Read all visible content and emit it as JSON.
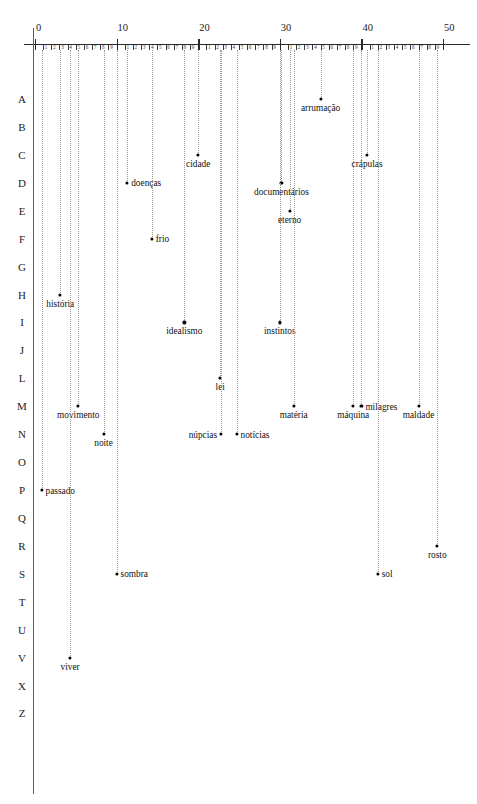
{
  "chart_data": {
    "type": "scatter",
    "title": "",
    "subtitle": "",
    "xlabel": "",
    "ylabel": "",
    "xlim": [
      0,
      52
    ],
    "ylim_categories": [
      "A",
      "B",
      "C",
      "D",
      "E",
      "F",
      "G",
      "H",
      "I",
      "J",
      "L",
      "M",
      "N",
      "O",
      "P",
      "Q",
      "R",
      "S",
      "T",
      "U",
      "V",
      "X",
      "Z"
    ],
    "grid": "vertical dotted stems dropping from top axis to each point",
    "legend": "none",
    "x_axis": {
      "major_ticks": [
        0,
        10,
        20,
        30,
        40,
        50
      ],
      "major_tick_labels": [
        "0",
        "10",
        "20",
        "30",
        "40",
        "50"
      ],
      "minor_tick_labels": [
        "1",
        "2",
        "3",
        "4",
        "5",
        "6",
        "7",
        "8",
        "9"
      ],
      "minor_ticks_per_interval": 9,
      "position": "top"
    },
    "y_axis": {
      "categories": [
        "A",
        "B",
        "C",
        "D",
        "E",
        "F",
        "G",
        "H",
        "I",
        "J",
        "L",
        "M",
        "N",
        "O",
        "P",
        "Q",
        "R",
        "S",
        "T",
        "U",
        "V",
        "X",
        "Z"
      ],
      "note": "Portuguese alphabet row labels; K, W and Y omitted",
      "position": "left"
    },
    "points": [
      {
        "label": "arrumação",
        "x": 35.0,
        "row": "A",
        "label_side": "below"
      },
      {
        "label": "cidade",
        "x": 20.0,
        "row": "C",
        "label_side": "below"
      },
      {
        "label": "crápulas",
        "x": 40.7,
        "row": "C",
        "label_side": "below"
      },
      {
        "label": "doenças",
        "x": 11.3,
        "row": "D",
        "label_side": "right"
      },
      {
        "label": "documentários",
        "x": 30.2,
        "row": "D",
        "label_side": "below"
      },
      {
        "label": "eterno",
        "x": 31.2,
        "row": "E",
        "label_side": "below"
      },
      {
        "label": "frio",
        "x": 14.3,
        "row": "F",
        "label_side": "right"
      },
      {
        "label": "história",
        "x": 3.1,
        "row": "H",
        "label_side": "below"
      },
      {
        "label": "idealismo",
        "x": 18.3,
        "row": "I",
        "label_side": "below"
      },
      {
        "label": "instintos",
        "x": 30.0,
        "row": "I",
        "label_side": "below"
      },
      {
        "label": "lei",
        "x": 22.7,
        "row": "L",
        "label_side": "below"
      },
      {
        "label": "movimento",
        "x": 5.3,
        "row": "M",
        "label_side": "below"
      },
      {
        "label": "matéria",
        "x": 31.7,
        "row": "M",
        "label_side": "below"
      },
      {
        "label": "máquina",
        "x": 39.0,
        "row": "M",
        "label_side": "below"
      },
      {
        "label": "milagres",
        "x": 40.0,
        "row": "M",
        "label_side": "right"
      },
      {
        "label": "maldade",
        "x": 47.0,
        "row": "M",
        "label_side": "below"
      },
      {
        "label": "noite",
        "x": 8.4,
        "row": "N",
        "label_side": "below"
      },
      {
        "label": "núpcias",
        "x": 22.8,
        "row": "N",
        "label_side": "left"
      },
      {
        "label": "notícias",
        "x": 24.7,
        "row": "N",
        "label_side": "right"
      },
      {
        "label": "passado",
        "x": 0.8,
        "row": "P",
        "label_side": "right"
      },
      {
        "label": "rosto",
        "x": 49.3,
        "row": "R",
        "label_side": "below"
      },
      {
        "label": "sombra",
        "x": 10.0,
        "row": "S",
        "label_side": "right"
      },
      {
        "label": "sol",
        "x": 42.0,
        "row": "S",
        "label_side": "right"
      },
      {
        "label": "viver",
        "x": 4.3,
        "row": "V",
        "label_side": "below"
      }
    ]
  },
  "colors": {
    "background": "#ffffff",
    "axis": "#2a2a2a",
    "stem": "#9a9a9a",
    "dot": "#000000",
    "text": "#111111"
  }
}
